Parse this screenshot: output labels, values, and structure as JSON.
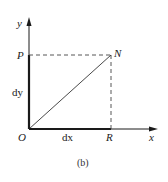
{
  "diagram": {
    "axes": {
      "x_label": "x",
      "y_label": "y"
    },
    "points": {
      "origin": "O",
      "P": "P",
      "N": "N",
      "R": "R"
    },
    "segments": {
      "vertical_label": "dy",
      "horizontal_label": "dx"
    },
    "caption": "(b)",
    "colors": {
      "stroke": "#1a1a1a",
      "dashed": "#444444",
      "background": "#ffffff"
    }
  }
}
